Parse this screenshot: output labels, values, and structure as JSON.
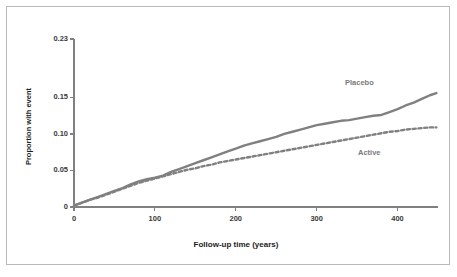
{
  "chart_data": {
    "type": "line",
    "title": "",
    "xlabel": "Follow-up time (years)",
    "ylabel": "Proportion with event",
    "xlim": [
      0,
      450
    ],
    "ylim": [
      0,
      0.23
    ],
    "xticks": [
      0,
      100,
      200,
      300,
      400
    ],
    "xtick_labels": [
      "0",
      "100",
      "200",
      "300",
      "400"
    ],
    "yticks": [
      0,
      0.05,
      0.1,
      0.15,
      0.23
    ],
    "ytick_labels": [
      "0",
      "0.05",
      "0.10",
      "0.15",
      "0.23"
    ],
    "grid": false,
    "legend_position": "inline-annotation",
    "line_color": "#808080",
    "axis_color": "#808080",
    "series": [
      {
        "name": "Placebo",
        "style": "solid",
        "color": "#808080",
        "annotation": "Placebo",
        "x": [
          0,
          10,
          20,
          30,
          40,
          50,
          60,
          70,
          80,
          90,
          100,
          110,
          120,
          130,
          140,
          150,
          160,
          170,
          180,
          190,
          200,
          210,
          220,
          230,
          240,
          250,
          260,
          270,
          280,
          290,
          300,
          310,
          320,
          330,
          340,
          350,
          360,
          370,
          380,
          390,
          400,
          410,
          420,
          430,
          440,
          448
        ],
        "y": [
          0.002,
          0.006,
          0.01,
          0.014,
          0.018,
          0.022,
          0.026,
          0.031,
          0.035,
          0.038,
          0.04,
          0.043,
          0.048,
          0.052,
          0.056,
          0.06,
          0.064,
          0.068,
          0.072,
          0.076,
          0.08,
          0.084,
          0.087,
          0.09,
          0.093,
          0.096,
          0.1,
          0.103,
          0.106,
          0.109,
          0.112,
          0.114,
          0.116,
          0.118,
          0.119,
          0.121,
          0.123,
          0.125,
          0.126,
          0.13,
          0.134,
          0.139,
          0.143,
          0.148,
          0.153,
          0.156
        ]
      },
      {
        "name": "Active",
        "style": "dashed",
        "color": "#808080",
        "annotation": "Active",
        "x": [
          0,
          10,
          20,
          30,
          40,
          50,
          60,
          70,
          80,
          90,
          100,
          110,
          120,
          130,
          140,
          150,
          160,
          170,
          180,
          190,
          200,
          210,
          220,
          230,
          240,
          250,
          260,
          270,
          280,
          290,
          300,
          310,
          320,
          330,
          340,
          350,
          360,
          370,
          380,
          390,
          400,
          410,
          420,
          430,
          440,
          448
        ],
        "y": [
          0.002,
          0.006,
          0.01,
          0.013,
          0.017,
          0.021,
          0.025,
          0.029,
          0.033,
          0.036,
          0.039,
          0.042,
          0.045,
          0.048,
          0.051,
          0.053,
          0.056,
          0.058,
          0.061,
          0.063,
          0.065,
          0.067,
          0.069,
          0.071,
          0.073,
          0.075,
          0.077,
          0.079,
          0.081,
          0.083,
          0.085,
          0.087,
          0.089,
          0.091,
          0.093,
          0.095,
          0.097,
          0.099,
          0.101,
          0.103,
          0.104,
          0.106,
          0.107,
          0.108,
          0.109,
          0.109
        ]
      }
    ]
  }
}
